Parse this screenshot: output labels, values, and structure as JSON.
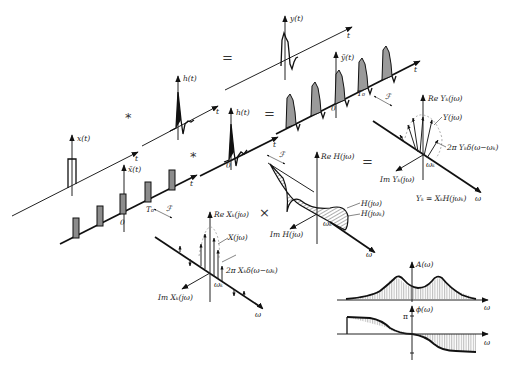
{
  "diagram": {
    "operators": {
      "convolve_top": "*",
      "equals_top": "=",
      "convolve_mid": "*",
      "equals_mid": "=",
      "multiply": "×",
      "equals_freq": "="
    },
    "time_domain": {
      "x_t": {
        "label": "x(t)",
        "axis": "t"
      },
      "h_t_top": {
        "label": "h(t)",
        "axis": "t"
      },
      "y_t": {
        "label": "y(t)",
        "axis": "t"
      },
      "x_tilde": {
        "label": "x̃(t)",
        "axis": "t",
        "origin": "0",
        "period": "T₀"
      },
      "h_t_mid": {
        "label": "h(t)",
        "axis": "t",
        "origin": "0"
      },
      "y_tilde": {
        "label": "ỹ(t)",
        "axis": "t",
        "origin": "0",
        "period": "T₀"
      }
    },
    "transform_symbol": "ℱ",
    "frequency_domain": {
      "X_spectrum": {
        "re_label": "Re Xₖ(jω)",
        "im_label": "Im Xₖ(jω)",
        "envelope_label": "X(jω)",
        "line_label": "2π Xₖδ(ω−ωₖ)",
        "freq_label": "ωₖ",
        "axis": "ω"
      },
      "H_response": {
        "re_label": "Re H(jω)",
        "im_label": "Im H(jω)",
        "curve_label": "H(jω)",
        "point_label": "H(jωₖ)",
        "freq_label": "ωₖ",
        "axis": "ω"
      },
      "Y_spectrum": {
        "re_label": "Re Yₖ(jω)",
        "im_label": "Im Yₖ(jω)",
        "envelope_label": "Y(jω)",
        "line_label": "2π Yₖδ(ω−ωₖ)",
        "freq_label": "ωₖ",
        "axis": "ω",
        "equation": "Yₖ = XₖH(jωₖ)"
      }
    },
    "bode": {
      "amplitude": {
        "label": "A(ω)",
        "axis": "ω"
      },
      "phase": {
        "label": "ϕ(ω)",
        "axis": "ω",
        "tick_top": "π",
        "tick_bottom": "−π"
      }
    }
  }
}
